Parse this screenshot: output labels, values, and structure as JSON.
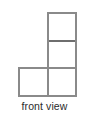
{
  "figure": {
    "name": "front-view-orthographic-figure",
    "stroke_color": "#8a8a8a",
    "divider_color": "#6e6e6e",
    "fill_color": "#ffffff",
    "stroke_width": 1.6,
    "cell_size": 28,
    "grid": {
      "columns": 2,
      "rows": 3,
      "origin_x": 19,
      "origin_y": 13
    },
    "cells": [
      {
        "label": "top-right-square",
        "col": 1,
        "row": 0,
        "x": 48,
        "y": 13,
        "w": 28,
        "h": 28
      },
      {
        "label": "middle-right-square",
        "col": 1,
        "row": 1,
        "x": 48,
        "y": 41,
        "w": 28,
        "h": 28
      },
      {
        "label": "bottom-left-square",
        "col": 0,
        "row": 2,
        "x": 19,
        "y": 68,
        "w": 29,
        "h": 28
      },
      {
        "label": "bottom-right-square",
        "col": 1,
        "row": 2,
        "x": 48,
        "y": 68,
        "w": 28,
        "h": 28
      }
    ],
    "outline_path": "M48,13 L76,13 L76,96 L19,96 L19,68 L48,68 Z",
    "interior_lines": [
      {
        "label": "divider-top-middle",
        "x1": 48,
        "y1": 41,
        "x2": 76,
        "y2": 41
      },
      {
        "label": "divider-middle-bottom",
        "x1": 48,
        "y1": 68,
        "x2": 76,
        "y2": 68
      },
      {
        "label": "divider-bottom-vertical",
        "x1": 48,
        "y1": 68,
        "x2": 48,
        "y2": 96
      }
    ]
  },
  "caption": {
    "text": "front view"
  }
}
